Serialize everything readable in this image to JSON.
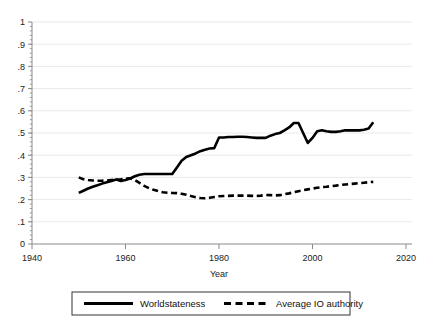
{
  "chart_data": {
    "type": "line",
    "title": "",
    "xlabel": "Year",
    "ylabel": "",
    "xlim": [
      1940,
      2020
    ],
    "ylim": [
      0,
      1
    ],
    "grid": true,
    "grid_axis": "y",
    "legend_position": "bottom",
    "xticks": [
      1940,
      1960,
      1980,
      2000,
      2020
    ],
    "xticklabels": [
      "1940",
      "1960",
      "1980",
      "2000",
      "2020"
    ],
    "yticks": [
      0,
      0.1,
      0.2,
      0.3,
      0.4,
      0.5,
      0.6,
      0.7,
      0.8,
      0.9,
      1
    ],
    "yticklabels": [
      "0",
      ".1",
      ".2",
      ".3",
      ".4",
      ".5",
      ".6",
      ".7",
      ".8",
      ".9",
      "1"
    ],
    "series": [
      {
        "name": "Worldstateness",
        "style": "solid",
        "color": "#000000",
        "x": [
          1950,
          1951,
          1952,
          1953,
          1954,
          1955,
          1956,
          1957,
          1958,
          1959,
          1960,
          1961,
          1962,
          1963,
          1964,
          1965,
          1966,
          1967,
          1968,
          1969,
          1970,
          1971,
          1972,
          1973,
          1974,
          1975,
          1976,
          1977,
          1978,
          1979,
          1980,
          1981,
          1982,
          1983,
          1984,
          1985,
          1986,
          1987,
          1988,
          1989,
          1990,
          1991,
          1992,
          1993,
          1994,
          1995,
          1996,
          1997,
          1998,
          1999,
          2000,
          2001,
          2002,
          2003,
          2004,
          2005,
          2006,
          2007,
          2008,
          2009,
          2010,
          2011,
          2012,
          2013
        ],
        "values": [
          0.23,
          0.24,
          0.25,
          0.258,
          0.265,
          0.272,
          0.278,
          0.284,
          0.29,
          0.284,
          0.288,
          0.295,
          0.305,
          0.312,
          0.315,
          0.315,
          0.315,
          0.315,
          0.315,
          0.315,
          0.315,
          0.345,
          0.375,
          0.392,
          0.4,
          0.408,
          0.418,
          0.425,
          0.43,
          0.432,
          0.48,
          0.48,
          0.482,
          0.482,
          0.483,
          0.483,
          0.482,
          0.48,
          0.478,
          0.478,
          0.478,
          0.488,
          0.495,
          0.5,
          0.512,
          0.525,
          0.545,
          0.545,
          0.5,
          0.455,
          0.478,
          0.508,
          0.512,
          0.508,
          0.505,
          0.505,
          0.508,
          0.512,
          0.512,
          0.512,
          0.512,
          0.515,
          0.52,
          0.548
        ]
      },
      {
        "name": "Average IO authority",
        "style": "dashed",
        "color": "#000000",
        "x": [
          1950,
          1951,
          1952,
          1953,
          1954,
          1955,
          1956,
          1957,
          1958,
          1959,
          1960,
          1961,
          1962,
          1963,
          1964,
          1965,
          1966,
          1967,
          1968,
          1969,
          1970,
          1971,
          1972,
          1973,
          1974,
          1975,
          1976,
          1977,
          1978,
          1979,
          1980,
          1981,
          1982,
          1983,
          1984,
          1985,
          1986,
          1987,
          1988,
          1989,
          1990,
          1991,
          1992,
          1993,
          1994,
          1995,
          1996,
          1997,
          1998,
          1999,
          2000,
          2001,
          2002,
          2003,
          2004,
          2005,
          2006,
          2007,
          2008,
          2009,
          2010,
          2011,
          2012,
          2013
        ],
        "values": [
          0.3,
          0.292,
          0.288,
          0.286,
          0.285,
          0.285,
          0.286,
          0.288,
          0.29,
          0.292,
          0.295,
          0.296,
          0.288,
          0.275,
          0.262,
          0.252,
          0.244,
          0.238,
          0.233,
          0.231,
          0.23,
          0.229,
          0.226,
          0.222,
          0.216,
          0.211,
          0.207,
          0.206,
          0.208,
          0.212,
          0.215,
          0.216,
          0.217,
          0.218,
          0.218,
          0.218,
          0.218,
          0.217,
          0.216,
          0.218,
          0.221,
          0.22,
          0.219,
          0.22,
          0.224,
          0.228,
          0.233,
          0.238,
          0.242,
          0.246,
          0.25,
          0.253,
          0.256,
          0.258,
          0.261,
          0.263,
          0.266,
          0.268,
          0.27,
          0.272,
          0.274,
          0.276,
          0.278,
          0.28
        ]
      }
    ]
  },
  "legend": {
    "entries": [
      {
        "label": "Worldstateness",
        "style": "solid"
      },
      {
        "label": "Average IO authority",
        "style": "dashed"
      }
    ]
  },
  "colors": {
    "line": "#000000",
    "grid": "#e9e9e9",
    "axis": "#8a8a8a",
    "text": "#222222",
    "legend_border": "#333333",
    "background": "#ffffff"
  }
}
